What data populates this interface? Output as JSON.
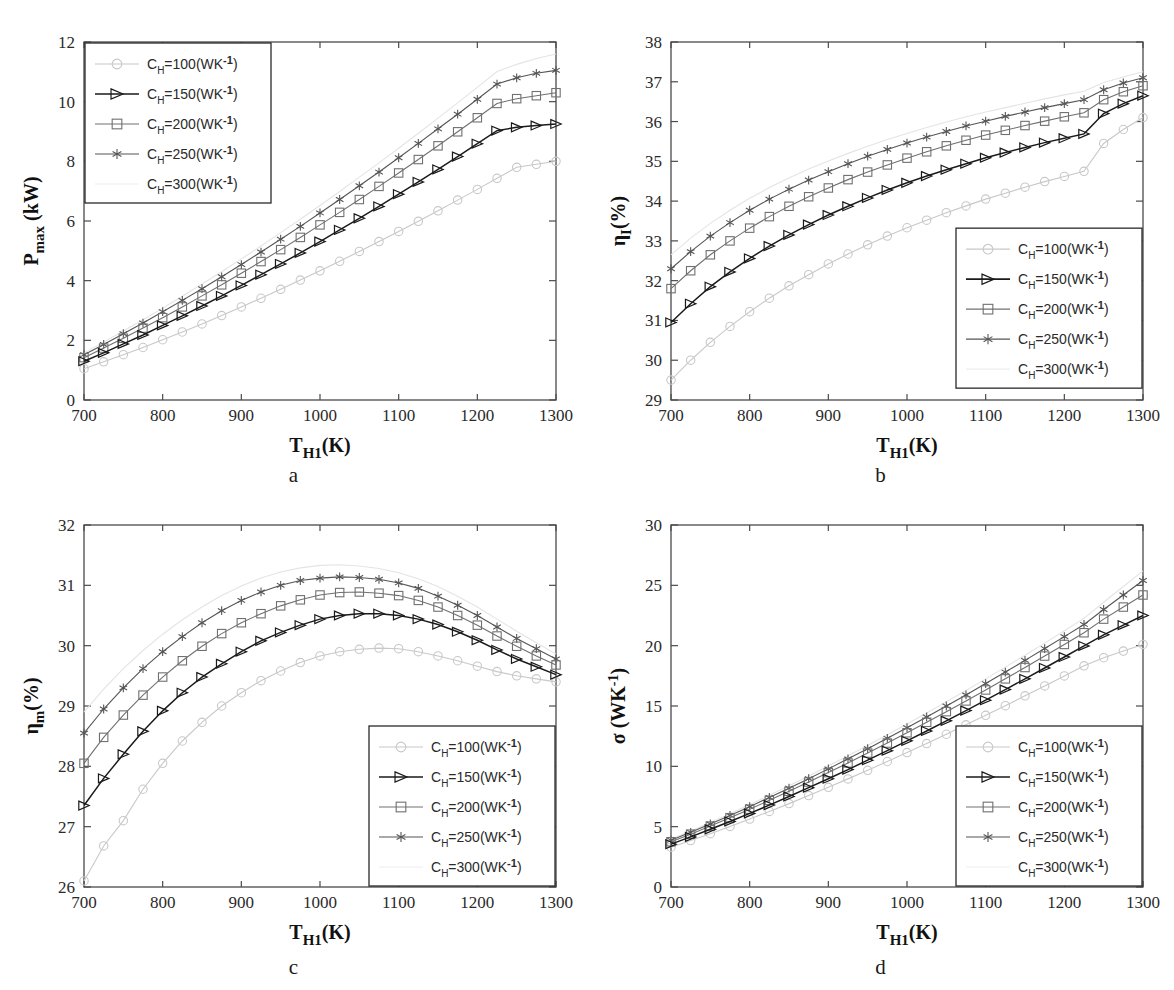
{
  "figure": {
    "panels": [
      {
        "letter": "a",
        "xlabel": "T",
        "xlabel_sub": "H1",
        "xlabel_unit": "(K)",
        "ylabel_main": "P",
        "ylabel_sub": "max",
        "ylabel_unit": " (kW)",
        "legend_position": "top-left"
      },
      {
        "letter": "b",
        "xlabel": "T",
        "xlabel_sub": "H1",
        "xlabel_unit": "(K)",
        "ylabel_main": "η",
        "ylabel_sub": "I",
        "ylabel_unit": "(%)",
        "legend_position": "middle-right"
      },
      {
        "letter": "c",
        "xlabel": "T",
        "xlabel_sub": "H1",
        "xlabel_unit": "(K)",
        "ylabel_main": "η",
        "ylabel_sub": "m",
        "ylabel_unit": "(%)",
        "legend_position": "bottom-right"
      },
      {
        "letter": "d",
        "xlabel": "T",
        "xlabel_sub": "H1",
        "xlabel_unit": "(K)",
        "ylabel_main": "σ",
        "ylabel_sub": "",
        "ylabel_unit": " (WK",
        "ylabel_sup": "-1",
        "ylabel_close": ")",
        "legend_position": "bottom-right"
      }
    ],
    "legend": {
      "entries": [
        {
          "label_prefix": "C",
          "label_sub": "H",
          "label_value": "=100(WK",
          "label_sup": "-1",
          "label_close": ")",
          "marker": "circle-marker",
          "color": "#c8c8c8"
        },
        {
          "label_prefix": "C",
          "label_sub": "H",
          "label_value": "=150(WK",
          "label_sup": "-1",
          "label_close": ")",
          "marker": "triangle-right-marker",
          "color": "#1a1a1a"
        },
        {
          "label_prefix": "C",
          "label_sub": "H",
          "label_value": "=200(WK",
          "label_sup": "-1",
          "label_close": ")",
          "marker": "square-marker",
          "color": "#707070"
        },
        {
          "label_prefix": "C",
          "label_sub": "H",
          "label_value": "=250(WK",
          "label_sup": "-1",
          "label_close": ")",
          "marker": "asterisk-marker",
          "color": "#555555"
        },
        {
          "label_prefix": "C",
          "label_sub": "H",
          "label_value": "=300(WK",
          "label_sup": "-1",
          "label_close": ")",
          "marker": "none-marker",
          "color": "#e0e0e0"
        }
      ]
    }
  },
  "chart_data": [
    {
      "id": "panel-a",
      "type": "line",
      "title": "",
      "xlabel": "T_H1 (K)",
      "ylabel": "P_max (kW)",
      "xlim": [
        700,
        1300
      ],
      "ylim": [
        0,
        12
      ],
      "xticks": [
        700,
        800,
        900,
        1000,
        1100,
        1200,
        1300
      ],
      "yticks": [
        0,
        2,
        4,
        6,
        8,
        10,
        12
      ],
      "grid": false,
      "legend_position": "upper left",
      "x": [
        700,
        725,
        750,
        775,
        800,
        825,
        850,
        875,
        900,
        925,
        950,
        975,
        1000,
        1025,
        1050,
        1075,
        1100,
        1125,
        1150,
        1175,
        1200,
        1225,
        1250,
        1275,
        1300
      ],
      "series": [
        {
          "name": "C_H=100(WK^-1)",
          "marker": "circle",
          "color": "#c8c8c8",
          "values": [
            1.05,
            1.28,
            1.52,
            1.76,
            2.02,
            2.28,
            2.55,
            2.83,
            3.12,
            3.41,
            3.71,
            4.02,
            4.33,
            4.65,
            4.98,
            5.31,
            5.65,
            5.99,
            6.34,
            6.7,
            7.06,
            7.43,
            7.8,
            7.9,
            8.0
          ]
        },
        {
          "name": "C_H=150(WK^-1)",
          "marker": "triangle-right",
          "color": "#1a1a1a",
          "values": [
            1.3,
            1.58,
            1.88,
            2.18,
            2.5,
            2.82,
            3.15,
            3.49,
            3.84,
            4.2,
            4.56,
            4.93,
            5.31,
            5.7,
            6.09,
            6.49,
            6.9,
            7.31,
            7.73,
            8.16,
            8.59,
            9.03,
            9.14,
            9.2,
            9.25
          ]
        },
        {
          "name": "C_H=200(WK^-1)",
          "marker": "square",
          "color": "#707070",
          "values": [
            1.42,
            1.74,
            2.07,
            2.41,
            2.76,
            3.12,
            3.49,
            3.86,
            4.25,
            4.64,
            5.04,
            5.45,
            5.87,
            6.29,
            6.72,
            7.16,
            7.61,
            8.06,
            8.52,
            8.99,
            9.46,
            9.94,
            10.1,
            10.2,
            10.3
          ]
        },
        {
          "name": "C_H=250(WK^-1)",
          "marker": "asterisk",
          "color": "#555555",
          "values": [
            1.52,
            1.86,
            2.22,
            2.58,
            2.96,
            3.34,
            3.73,
            4.13,
            4.54,
            4.96,
            5.39,
            5.82,
            6.27,
            6.72,
            7.18,
            7.64,
            8.12,
            8.6,
            9.09,
            9.58,
            10.08,
            10.59,
            10.8,
            10.95,
            11.05
          ]
        },
        {
          "name": "C_H=300(WK^-1)",
          "marker": "none",
          "color": "#e4e4e4",
          "values": [
            1.58,
            1.94,
            2.31,
            2.69,
            3.08,
            3.48,
            3.89,
            4.3,
            4.73,
            5.16,
            5.61,
            6.06,
            6.52,
            6.99,
            7.47,
            7.95,
            8.44,
            8.94,
            9.45,
            9.96,
            10.48,
            11.01,
            11.25,
            11.45,
            11.6
          ]
        }
      ]
    },
    {
      "id": "panel-b",
      "type": "line",
      "title": "",
      "xlabel": "T_H1 (K)",
      "ylabel": "eta_I (%)",
      "xlim": [
        700,
        1300
      ],
      "ylim": [
        29,
        38
      ],
      "xticks": [
        700,
        800,
        900,
        1000,
        1100,
        1200,
        1300
      ],
      "yticks": [
        29,
        30,
        31,
        32,
        33,
        34,
        35,
        36,
        37,
        38
      ],
      "grid": false,
      "legend_position": "center right",
      "x": [
        700,
        725,
        750,
        775,
        800,
        825,
        850,
        875,
        900,
        925,
        950,
        975,
        1000,
        1025,
        1050,
        1075,
        1100,
        1125,
        1150,
        1175,
        1200,
        1225,
        1250,
        1275,
        1300
      ],
      "series": [
        {
          "name": "C_H=100(WK^-1)",
          "marker": "circle",
          "color": "#c8c8c8",
          "values": [
            29.5,
            30.0,
            30.45,
            30.85,
            31.22,
            31.56,
            31.87,
            32.15,
            32.42,
            32.67,
            32.9,
            33.12,
            33.33,
            33.52,
            33.71,
            33.88,
            34.05,
            34.2,
            34.35,
            34.49,
            34.62,
            34.75,
            35.45,
            35.8,
            36.1
          ]
        },
        {
          "name": "C_H=150(WK^-1)",
          "marker": "triangle-right",
          "color": "#1a1a1a",
          "values": [
            30.95,
            31.42,
            31.85,
            32.22,
            32.56,
            32.87,
            33.15,
            33.41,
            33.65,
            33.87,
            34.08,
            34.28,
            34.46,
            34.63,
            34.79,
            34.94,
            35.09,
            35.22,
            35.35,
            35.47,
            35.58,
            35.69,
            36.2,
            36.45,
            36.65
          ]
        },
        {
          "name": "C_H=200(WK^-1)",
          "marker": "square",
          "color": "#707070",
          "values": [
            31.8,
            32.25,
            32.65,
            33.0,
            33.32,
            33.61,
            33.87,
            34.11,
            34.33,
            34.54,
            34.73,
            34.91,
            35.08,
            35.24,
            35.39,
            35.53,
            35.66,
            35.78,
            35.9,
            36.01,
            36.12,
            36.22,
            36.55,
            36.75,
            36.9
          ]
        },
        {
          "name": "C_H=250(WK^-1)",
          "marker": "asterisk",
          "color": "#555555",
          "values": [
            32.3,
            32.73,
            33.12,
            33.46,
            33.77,
            34.05,
            34.3,
            34.53,
            34.74,
            34.94,
            35.13,
            35.3,
            35.46,
            35.61,
            35.75,
            35.89,
            36.01,
            36.13,
            36.24,
            36.35,
            36.45,
            36.55,
            36.8,
            36.97,
            37.1
          ]
        },
        {
          "name": "C_H=300(WK^-1)",
          "marker": "none",
          "color": "#e4e4e4",
          "values": [
            32.65,
            33.07,
            33.44,
            33.77,
            34.07,
            34.34,
            34.58,
            34.81,
            35.01,
            35.2,
            35.38,
            35.55,
            35.7,
            35.85,
            35.99,
            36.12,
            36.24,
            36.35,
            36.46,
            36.57,
            36.67,
            36.76,
            36.98,
            37.12,
            37.25
          ]
        }
      ]
    },
    {
      "id": "panel-c",
      "type": "line",
      "title": "",
      "xlabel": "T_H1 (K)",
      "ylabel": "eta_m (%)",
      "xlim": [
        700,
        1300
      ],
      "ylim": [
        26,
        32
      ],
      "xticks": [
        700,
        800,
        900,
        1000,
        1100,
        1200,
        1300
      ],
      "yticks": [
        26,
        27,
        28,
        29,
        30,
        31,
        32
      ],
      "grid": false,
      "legend_position": "lower right",
      "x": [
        700,
        725,
        750,
        775,
        800,
        825,
        850,
        875,
        900,
        925,
        950,
        975,
        1000,
        1025,
        1050,
        1075,
        1100,
        1125,
        1150,
        1175,
        1200,
        1225,
        1250,
        1275,
        1300
      ],
      "series": [
        {
          "name": "C_H=100(WK^-1)",
          "marker": "circle",
          "color": "#c8c8c8",
          "values": [
            26.1,
            26.68,
            27.1,
            27.62,
            28.05,
            28.42,
            28.73,
            29.0,
            29.22,
            29.42,
            29.58,
            29.72,
            29.83,
            29.9,
            29.94,
            29.96,
            29.95,
            29.9,
            29.83,
            29.75,
            29.66,
            29.57,
            29.5,
            29.45,
            29.4
          ]
        },
        {
          "name": "C_H=150(WK^-1)",
          "marker": "triangle-right",
          "color": "#1a1a1a",
          "values": [
            27.35,
            27.8,
            28.2,
            28.58,
            28.92,
            29.22,
            29.48,
            29.7,
            29.9,
            30.08,
            30.22,
            30.34,
            30.44,
            30.5,
            30.53,
            30.53,
            30.5,
            30.44,
            30.35,
            30.23,
            30.09,
            29.93,
            29.78,
            29.65,
            29.52
          ]
        },
        {
          "name": "C_H=200(WK^-1)",
          "marker": "square",
          "color": "#707070",
          "values": [
            28.05,
            28.48,
            28.85,
            29.18,
            29.48,
            29.75,
            29.99,
            30.2,
            30.38,
            30.53,
            30.66,
            30.76,
            30.84,
            30.88,
            30.89,
            30.87,
            30.83,
            30.75,
            30.64,
            30.5,
            30.34,
            30.16,
            29.99,
            29.83,
            29.68
          ]
        },
        {
          "name": "C_H=250(WK^-1)",
          "marker": "asterisk",
          "color": "#555555",
          "values": [
            28.55,
            28.95,
            29.3,
            29.62,
            29.9,
            30.15,
            30.38,
            30.58,
            30.75,
            30.89,
            31.0,
            31.08,
            31.12,
            31.14,
            31.13,
            31.1,
            31.04,
            30.95,
            30.82,
            30.67,
            30.5,
            30.31,
            30.12,
            29.95,
            29.78
          ]
        },
        {
          "name": "C_H=300(WK^-1)",
          "marker": "none",
          "color": "#e4e4e4",
          "values": [
            28.9,
            29.28,
            29.62,
            29.92,
            30.19,
            30.43,
            30.64,
            30.83,
            30.99,
            31.12,
            31.22,
            31.29,
            31.33,
            31.34,
            31.32,
            31.28,
            31.21,
            31.11,
            30.98,
            30.82,
            30.64,
            30.44,
            30.24,
            30.05,
            29.86
          ]
        }
      ]
    },
    {
      "id": "panel-d",
      "type": "line",
      "title": "",
      "xlabel": "T_H1 (K)",
      "ylabel": "sigma (WK^-1)",
      "xlim": [
        700,
        1300
      ],
      "ylim": [
        0,
        30
      ],
      "xticks": [
        700,
        800,
        900,
        1000,
        1100,
        1200,
        1300
      ],
      "yticks": [
        0,
        5,
        10,
        15,
        20,
        25,
        30
      ],
      "grid": false,
      "legend_position": "lower right",
      "x": [
        700,
        725,
        750,
        775,
        800,
        825,
        850,
        875,
        900,
        925,
        950,
        975,
        1000,
        1025,
        1050,
        1075,
        1100,
        1125,
        1150,
        1175,
        1200,
        1225,
        1250,
        1275,
        1300
      ],
      "series": [
        {
          "name": "C_H=100(WK^-1)",
          "marker": "circle",
          "color": "#c8c8c8",
          "values": [
            3.3,
            3.85,
            4.42,
            5.02,
            5.63,
            6.26,
            6.91,
            7.58,
            8.26,
            8.96,
            9.67,
            10.4,
            11.14,
            11.89,
            12.66,
            13.44,
            14.23,
            15.03,
            15.84,
            16.66,
            17.49,
            18.33,
            19.0,
            19.55,
            20.1
          ]
        },
        {
          "name": "C_H=150(WK^-1)",
          "marker": "triangle-right",
          "color": "#1a1a1a",
          "values": [
            3.55,
            4.15,
            4.78,
            5.43,
            6.1,
            6.79,
            7.5,
            8.23,
            8.97,
            9.73,
            10.51,
            11.3,
            12.11,
            12.93,
            13.77,
            14.62,
            15.48,
            16.36,
            17.25,
            18.15,
            19.06,
            19.98,
            20.9,
            21.7,
            22.5
          ]
        },
        {
          "name": "C_H=200(WK^-1)",
          "marker": "square",
          "color": "#707070",
          "values": [
            3.75,
            4.38,
            5.05,
            5.74,
            6.45,
            7.18,
            7.93,
            8.7,
            9.48,
            10.28,
            11.1,
            11.93,
            12.78,
            13.65,
            14.53,
            15.42,
            16.33,
            17.25,
            18.19,
            19.14,
            20.1,
            21.07,
            22.2,
            23.2,
            24.2
          ]
        },
        {
          "name": "C_H=250(WK^-1)",
          "marker": "asterisk",
          "color": "#555555",
          "values": [
            3.88,
            4.53,
            5.22,
            5.93,
            6.66,
            7.42,
            8.19,
            8.98,
            9.79,
            10.62,
            11.46,
            12.32,
            13.2,
            14.09,
            15.0,
            15.92,
            16.86,
            17.81,
            18.78,
            19.76,
            20.75,
            21.76,
            23.0,
            24.2,
            25.4
          ]
        },
        {
          "name": "C_H=300(WK^-1)",
          "marker": "none",
          "color": "#e4e4e4",
          "values": [
            3.98,
            4.65,
            5.35,
            6.08,
            6.83,
            7.6,
            8.39,
            9.2,
            10.03,
            10.87,
            11.73,
            12.61,
            13.51,
            14.42,
            15.35,
            16.29,
            17.25,
            18.22,
            19.21,
            20.21,
            21.23,
            22.26,
            23.6,
            24.9,
            26.2
          ]
        }
      ]
    }
  ]
}
